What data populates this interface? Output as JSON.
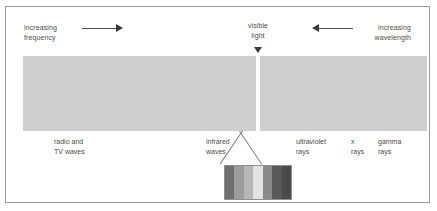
{
  "figure": {
    "background_color": "#ffffff",
    "border_color": "#9a9a9a",
    "bar_color": "#cfcfcf",
    "text_color": "#4b4b4b"
  },
  "annotations": {
    "increasing_frequency": "increasing\nfrequency",
    "increasing_frequency_line1": "increasing",
    "increasing_frequency_line2": "frequency",
    "increasing_wavelength_line1": "increasing",
    "increasing_wavelength_line2": "wavelength",
    "visible_light_line1": "visible",
    "visible_light_line2": "light",
    "left_arrow_direction": "right",
    "right_arrow_direction": "left",
    "center_pointer_direction": "down"
  },
  "bands": [
    {
      "id": "radio-tv",
      "line1": "radio and",
      "line2": "TV waves"
    },
    {
      "id": "infrared",
      "line1": "infrared",
      "line2": "waves"
    },
    {
      "id": "ultraviolet",
      "line1": "ultraviolet",
      "line2": "rays"
    },
    {
      "id": "x-rays",
      "line1": "x",
      "line2": "rays"
    },
    {
      "id": "gamma-rays",
      "line1": "gamma",
      "line2": "rays"
    }
  ],
  "chart_data": {
    "type": "bar",
    "xlabel": "",
    "ylabel": "",
    "grid": false,
    "legend": "none",
    "orientation": "horizontal",
    "axis_direction_left": "increasing frequency",
    "axis_direction_right": "increasing wavelength",
    "categories": [
      "radio and TV waves",
      "infrared waves",
      "visible light",
      "ultraviolet rays",
      "x rays",
      "gamma rays"
    ],
    "segment_widths_px": [
      233,
      0,
      4,
      167,
      0,
      0
    ],
    "segment_color": "#cfcfcf",
    "visible_light_gap_color": "#ffffff",
    "detail_callout": {
      "label": "visible light spectrum",
      "type": "bar",
      "categories": [
        "red",
        "orange",
        "yellow",
        "green",
        "blue",
        "indigo",
        "violet"
      ],
      "values": [
        1,
        1,
        1,
        1,
        1,
        1,
        1
      ],
      "colors": [
        "#6f6f6f",
        "#9d9d9d",
        "#b7b7b7",
        "#e4e4e4",
        "#8a8a8a",
        "#585858",
        "#4a4a4a"
      ]
    }
  }
}
